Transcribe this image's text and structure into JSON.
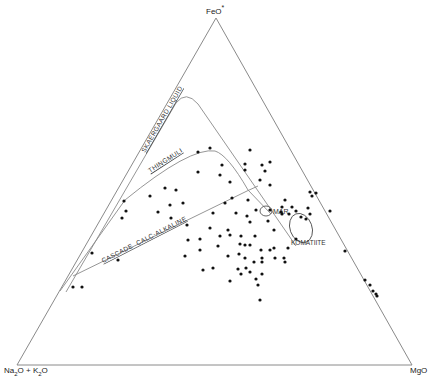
{
  "diagram": {
    "type": "AFM ternary diagram",
    "vertices": {
      "top": {
        "label": "FeO",
        "suffix": "*"
      },
      "bottom_left": {
        "label_parts": [
          "Na",
          "2",
          "O + K",
          "2",
          "O"
        ]
      },
      "bottom_right": {
        "label": "MgO"
      }
    },
    "curve_labels": {
      "skaergaard": "SKAERGAARD LIQUID",
      "thingmuli": "THINGMULI",
      "cascade": "CASCADE  CALC-ALKALINE",
      "mar": "MAR",
      "komatiite": "KOMATIITE"
    },
    "colors": {
      "line": "#8a8a8a",
      "point": "#111111",
      "text": "#222222"
    },
    "points": [
      [
        73,
        287
      ],
      [
        82,
        287
      ],
      [
        92,
        253
      ],
      [
        118,
        260
      ],
      [
        124,
        201
      ],
      [
        122,
        218
      ],
      [
        150,
        196
      ],
      [
        126,
        211
      ],
      [
        158,
        212
      ],
      [
        165,
        188
      ],
      [
        170,
        205
      ],
      [
        171,
        218
      ],
      [
        176,
        190
      ],
      [
        183,
        203
      ],
      [
        187,
        225
      ],
      [
        188,
        240
      ],
      [
        185,
        256
      ],
      [
        198,
        172
      ],
      [
        198,
        152
      ],
      [
        210,
        148
      ],
      [
        220,
        175
      ],
      [
        222,
        165
      ],
      [
        230,
        182
      ],
      [
        225,
        203
      ],
      [
        232,
        198
      ],
      [
        228,
        230
      ],
      [
        236,
        213
      ],
      [
        245,
        164
      ],
      [
        245,
        170
      ],
      [
        248,
        200
      ],
      [
        247,
        216
      ],
      [
        250,
        222
      ],
      [
        256,
        210
      ],
      [
        255,
        236
      ],
      [
        260,
        180
      ],
      [
        270,
        185
      ],
      [
        265,
        171
      ],
      [
        268,
        221
      ],
      [
        270,
        210
      ],
      [
        274,
        230
      ],
      [
        282,
        214
      ],
      [
        282,
        207
      ],
      [
        289,
        214
      ],
      [
        296,
        211
      ],
      [
        301,
        217
      ],
      [
        306,
        219
      ],
      [
        308,
        208
      ],
      [
        312,
        196
      ],
      [
        250,
        150
      ],
      [
        262,
        165
      ],
      [
        270,
        162
      ],
      [
        281,
        212
      ],
      [
        285,
        200
      ],
      [
        250,
        245
      ],
      [
        245,
        258
      ],
      [
        245,
        245
      ],
      [
        239,
        254
      ],
      [
        241,
        236
      ],
      [
        230,
        235
      ],
      [
        262,
        262
      ],
      [
        262,
        274
      ],
      [
        246,
        268
      ],
      [
        250,
        272
      ],
      [
        254,
        262
      ],
      [
        238,
        269
      ],
      [
        241,
        274
      ],
      [
        230,
        281
      ],
      [
        200,
        239
      ],
      [
        200,
        250
      ],
      [
        203,
        270
      ],
      [
        213,
        268
      ],
      [
        218,
        246
      ],
      [
        228,
        256
      ],
      [
        256,
        279
      ],
      [
        258,
        285
      ],
      [
        210,
        228
      ],
      [
        213,
        213
      ],
      [
        220,
        236
      ],
      [
        261,
        250
      ],
      [
        262,
        258
      ],
      [
        270,
        250
      ],
      [
        274,
        248
      ],
      [
        275,
        258
      ],
      [
        296,
        239
      ],
      [
        292,
        207
      ],
      [
        310,
        214
      ],
      [
        288,
        248
      ],
      [
        260,
        300
      ],
      [
        310,
        192
      ],
      [
        316,
        193
      ],
      [
        330,
        211
      ],
      [
        345,
        251
      ],
      [
        365,
        280
      ],
      [
        370,
        285
      ],
      [
        373,
        291
      ],
      [
        376,
        294
      ],
      [
        377,
        296
      ],
      [
        240,
        244
      ],
      [
        284,
        258
      ],
      [
        285,
        262
      ]
    ],
    "mar_ellipse": {
      "cx": 266,
      "cy": 211,
      "rx": 6,
      "ry": 5
    },
    "komatiite_ellipse": {
      "cx": 302,
      "cy": 229,
      "rx": 12,
      "ry": 15
    }
  }
}
